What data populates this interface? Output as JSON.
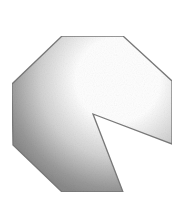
{
  "diagram": {
    "shape": "octagon-with-wedge-cutout",
    "width": 187,
    "height": 197,
    "vertices": [
      [
        62,
        36
      ],
      [
        123,
        36
      ],
      [
        172,
        81
      ],
      [
        172,
        144
      ],
      [
        93,
        114
      ],
      [
        123,
        192
      ],
      [
        62,
        192
      ],
      [
        13,
        145
      ],
      [
        12,
        84
      ]
    ],
    "colors": {
      "background": "#ffffff",
      "stroke": "#7a7a7a",
      "gradient_dark": "#8c8c8c",
      "gradient_mid": "#c8c8c8",
      "gradient_light": "#ffffff"
    }
  }
}
